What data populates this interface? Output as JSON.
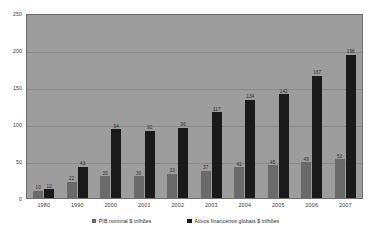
{
  "chart_data": {
    "type": "bar",
    "title": "",
    "xlabel": "",
    "ylabel": "",
    "ylim": [
      0,
      250
    ],
    "yticks": [
      "0",
      "50",
      "100",
      "150",
      "200",
      "250"
    ],
    "grid": true,
    "legend_position": "bottom",
    "categories": [
      "1980",
      "1990",
      "2000",
      "2001",
      "2002",
      "2003",
      "2004",
      "2005",
      "2006",
      "2007"
    ],
    "series": [
      {
        "name": "PIB nominal $ trilhões",
        "color": "#6a6a6a",
        "values": [
          10,
          22,
          30,
          30,
          33,
          37,
          42,
          45,
          49,
          53
        ]
      },
      {
        "name": "Ativos financeiros globais $ trilhões",
        "color": "#1a1a1a",
        "values": [
          12,
          43,
          94,
          92,
          96,
          117,
          134,
          142,
          167,
          196
        ]
      }
    ]
  },
  "legend": {
    "items": [
      {
        "label": "PIB nominal $ trilhões",
        "swatch": "legend-swatch-gdp"
      },
      {
        "label": "Ativos financeiros globais $ trilhões",
        "swatch": "legend-swatch-assets"
      }
    ]
  }
}
